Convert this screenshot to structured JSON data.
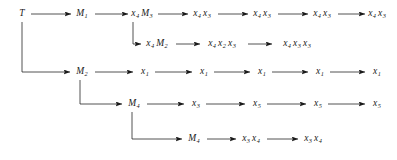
{
  "diagram": {
    "type": "derivation-tree",
    "title": "",
    "ink_color": "#1a1a1a",
    "background": "#ffffff",
    "nodes": [
      {
        "id": "n_t",
        "label": "T",
        "base": "T",
        "sub": "",
        "x": 22,
        "y": 14
      },
      {
        "id": "n_m1",
        "label": "M1",
        "base": "M",
        "sub": "1",
        "x": 82,
        "y": 14
      },
      {
        "id": "n_x4m3",
        "label": "x4 M3",
        "base": "",
        "sub": "",
        "x": 142,
        "y": 14
      },
      {
        "id": "n_x4x3_a",
        "label": "x4 x3",
        "base": "",
        "sub": "",
        "x": 202,
        "y": 14
      },
      {
        "id": "n_x4x3_b",
        "label": "x4 x3",
        "base": "",
        "sub": "",
        "x": 262,
        "y": 14
      },
      {
        "id": "n_x4x3_c",
        "label": "x4 x3",
        "base": "",
        "sub": "",
        "x": 322,
        "y": 14
      },
      {
        "id": "n_x4x3_d",
        "label": "x4 x3",
        "base": "",
        "sub": "",
        "x": 377,
        "y": 14
      },
      {
        "id": "n_x4m2",
        "label": "x4 M2",
        "base": "",
        "sub": "",
        "x": 157,
        "y": 44
      },
      {
        "id": "n_x4x2x3",
        "label": "x4 x2 x3",
        "base": "",
        "sub": "",
        "x": 222,
        "y": 44
      },
      {
        "id": "n_x4x3x3",
        "label": "x4 x3 x3",
        "base": "",
        "sub": "",
        "x": 297,
        "y": 44
      },
      {
        "id": "n_m2",
        "label": "M2",
        "base": "M",
        "sub": "2",
        "x": 82,
        "y": 72
      },
      {
        "id": "n_x1_a",
        "label": "x1",
        "base": "x",
        "sub": "1",
        "x": 145,
        "y": 72
      },
      {
        "id": "n_x1_b",
        "label": "x1",
        "base": "x",
        "sub": "1",
        "x": 204,
        "y": 72
      },
      {
        "id": "n_x1_c",
        "label": "x1",
        "base": "x",
        "sub": "1",
        "x": 262,
        "y": 72
      },
      {
        "id": "n_x1_d",
        "label": "x1",
        "base": "x",
        "sub": "1",
        "x": 320,
        "y": 72
      },
      {
        "id": "n_x1_e",
        "label": "x1",
        "base": "x",
        "sub": "1",
        "x": 377,
        "y": 72
      },
      {
        "id": "n_m4_top",
        "label": "M4",
        "base": "M",
        "sub": "4",
        "x": 134,
        "y": 104
      },
      {
        "id": "n_x3_r4",
        "label": "x3",
        "base": "x",
        "sub": "3",
        "x": 196,
        "y": 104
      },
      {
        "id": "n_x5_a",
        "label": "x5",
        "base": "x",
        "sub": "5",
        "x": 257,
        "y": 104
      },
      {
        "id": "n_x5_b",
        "label": "x5",
        "base": "x",
        "sub": "5",
        "x": 318,
        "y": 104
      },
      {
        "id": "n_x5_c",
        "label": "x5",
        "base": "x",
        "sub": "5",
        "x": 377,
        "y": 104
      },
      {
        "id": "n_m4_bot",
        "label": "M4",
        "base": "M",
        "sub": "4",
        "x": 194,
        "y": 139
      },
      {
        "id": "n_x3x4_a",
        "label": "x3 x4",
        "base": "",
        "sub": "",
        "x": 251,
        "y": 139
      },
      {
        "id": "n_x3x4_b",
        "label": "x3 x4",
        "base": "",
        "sub": "",
        "x": 313,
        "y": 139
      }
    ],
    "compound_nodes": {
      "n_x4m3": [
        {
          "base": "x",
          "sub": "4"
        },
        {
          "base": "M",
          "sub": "3"
        }
      ],
      "n_x4x3_a": [
        {
          "base": "x",
          "sub": "4"
        },
        {
          "base": "x",
          "sub": "3"
        }
      ],
      "n_x4x3_b": [
        {
          "base": "x",
          "sub": "4"
        },
        {
          "base": "x",
          "sub": "3"
        }
      ],
      "n_x4x3_c": [
        {
          "base": "x",
          "sub": "4"
        },
        {
          "base": "x",
          "sub": "3"
        }
      ],
      "n_x4x3_d": [
        {
          "base": "x",
          "sub": "4"
        },
        {
          "base": "x",
          "sub": "3"
        }
      ],
      "n_x4m2": [
        {
          "base": "x",
          "sub": "4"
        },
        {
          "base": "M",
          "sub": "2"
        }
      ],
      "n_x4x2x3": [
        {
          "base": "x",
          "sub": "4"
        },
        {
          "base": "x",
          "sub": "2"
        },
        {
          "base": "x",
          "sub": "3"
        }
      ],
      "n_x4x3x3": [
        {
          "base": "x",
          "sub": "4"
        },
        {
          "base": "x",
          "sub": "3"
        },
        {
          "base": "x",
          "sub": "3"
        }
      ],
      "n_x3x4_a": [
        {
          "base": "x",
          "sub": "3"
        },
        {
          "base": "x",
          "sub": "4"
        }
      ],
      "n_x3x4_b": [
        {
          "base": "x",
          "sub": "3"
        },
        {
          "base": "x",
          "sub": "4"
        }
      ]
    },
    "rows": [
      {
        "name": "row-1-main-derivation",
        "y": 14,
        "sequence": [
          "T",
          "M1",
          "x4 M3",
          "x4 x3",
          "x4 x3",
          "x4 x3",
          "x4 x3"
        ]
      },
      {
        "name": "row-2-m3-branch",
        "y": 44,
        "sequence": [
          "x4 M2",
          "x4 x2 x3",
          "x4 x3 x3"
        ]
      },
      {
        "name": "row-3-m2-branch",
        "y": 72,
        "sequence": [
          "M2",
          "x1",
          "x1",
          "x1",
          "x1",
          "x1"
        ]
      },
      {
        "name": "row-4-m4-branch",
        "y": 104,
        "sequence": [
          "M4",
          "x3",
          "x5",
          "x5",
          "x5"
        ]
      },
      {
        "name": "row-5-m4-lower-branch",
        "y": 139,
        "sequence": [
          "M4",
          "x3 x4",
          "x3 x4"
        ]
      }
    ],
    "edges": [
      {
        "from": "n_t",
        "to": "n_m1",
        "kind": "horizontal-arrow"
      },
      {
        "from": "n_m1",
        "to": "n_x4m3",
        "kind": "horizontal-arrow"
      },
      {
        "from": "n_x4m3",
        "to": "n_x4x3_a",
        "kind": "horizontal-arrow"
      },
      {
        "from": "n_x4x3_a",
        "to": "n_x4x3_b",
        "kind": "horizontal-arrow"
      },
      {
        "from": "n_x4x3_b",
        "to": "n_x4x3_c",
        "kind": "horizontal-arrow"
      },
      {
        "from": "n_x4x3_c",
        "to": "n_x4x3_d",
        "kind": "horizontal-arrow"
      },
      {
        "from": "n_x4m3",
        "to": "n_x4m2",
        "kind": "elbow-branch-arrow"
      },
      {
        "from": "n_x4m2",
        "to": "n_x4x2x3",
        "kind": "horizontal-arrow"
      },
      {
        "from": "n_x4x2x3",
        "to": "n_x4x3x3",
        "kind": "horizontal-arrow"
      },
      {
        "from": "n_t",
        "to": "n_m2",
        "kind": "elbow-branch-arrow"
      },
      {
        "from": "n_m2",
        "to": "n_x1_a",
        "kind": "horizontal-arrow"
      },
      {
        "from": "n_x1_a",
        "to": "n_x1_b",
        "kind": "horizontal-arrow"
      },
      {
        "from": "n_x1_b",
        "to": "n_x1_c",
        "kind": "horizontal-arrow"
      },
      {
        "from": "n_x1_c",
        "to": "n_x1_d",
        "kind": "horizontal-arrow"
      },
      {
        "from": "n_x1_d",
        "to": "n_x1_e",
        "kind": "horizontal-arrow"
      },
      {
        "from": "n_m2",
        "to": "n_m4_top",
        "kind": "elbow-branch-arrow"
      },
      {
        "from": "n_m4_top",
        "to": "n_x3_r4",
        "kind": "horizontal-arrow"
      },
      {
        "from": "n_x3_r4",
        "to": "n_x5_a",
        "kind": "horizontal-arrow"
      },
      {
        "from": "n_x5_a",
        "to": "n_x5_b",
        "kind": "horizontal-arrow"
      },
      {
        "from": "n_x5_b",
        "to": "n_x5_c",
        "kind": "horizontal-arrow"
      },
      {
        "from": "n_m4_top",
        "to": "n_m4_bot",
        "kind": "elbow-branch-arrow"
      },
      {
        "from": "n_m4_bot",
        "to": "n_x3x4_a",
        "kind": "horizontal-arrow"
      },
      {
        "from": "n_x3x4_a",
        "to": "n_x3x4_b",
        "kind": "horizontal-arrow"
      }
    ]
  }
}
